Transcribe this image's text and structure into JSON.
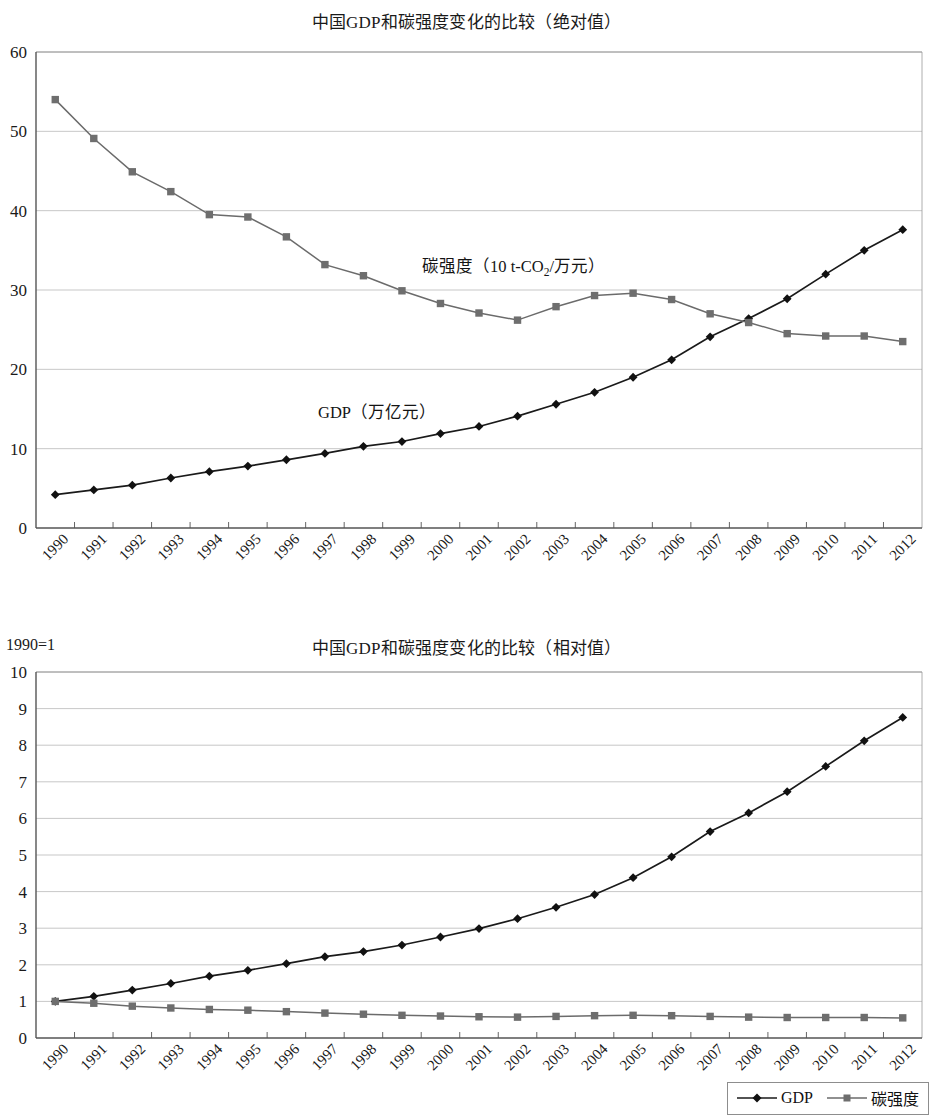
{
  "charts": {
    "absolute": {
      "title": "中国GDP和碳强度变化的比较（绝对值）",
      "gdp_annotation": "GDP（万亿元）",
      "intensity_annotation_pre": "碳强度（10 t-CO",
      "intensity_annotation_sub": "2",
      "intensity_annotation_post": "/万元）"
    },
    "relative": {
      "title": "中国GDP和碳强度变化的比较（相对值）",
      "base_note": "1990=1"
    }
  },
  "legend": {
    "gdp_label": "GDP",
    "intensity_label": "碳强度",
    "gdp_marker": "diamond-marker",
    "intensity_marker": "square-marker"
  },
  "colors": {
    "gdp_line": "#1a1a1a",
    "intensity_line": "#6b6b6b",
    "intensity_marker": "#6e6e6e",
    "grid": "#b9b9b9",
    "axis": "#555555"
  },
  "chart_data": [
    {
      "type": "line",
      "title": "中国GDP和碳强度变化的比较（绝对值）",
      "xlabel": "",
      "ylabel": "",
      "ylim": [
        0,
        60
      ],
      "yticks": [
        0,
        10,
        20,
        30,
        40,
        50,
        60
      ],
      "grid": true,
      "legend_position": "bottom-right",
      "x": [
        "1990",
        "1991",
        "1992",
        "1993",
        "1994",
        "1995",
        "1996",
        "1997",
        "1998",
        "1999",
        "2000",
        "2001",
        "2002",
        "2003",
        "2004",
        "2005",
        "2006",
        "2007",
        "2008",
        "2009",
        "2010",
        "2011",
        "2012"
      ],
      "series": [
        {
          "name": "GDP（万亿元）",
          "unit": "万亿元",
          "marker": "diamond",
          "values": [
            4.2,
            4.8,
            5.4,
            6.3,
            7.1,
            7.8,
            8.6,
            9.4,
            10.3,
            10.9,
            11.9,
            12.8,
            14.1,
            15.6,
            17.1,
            19.0,
            21.2,
            24.1,
            26.4,
            28.9,
            32.0,
            35.0,
            37.6
          ]
        },
        {
          "name": "碳强度（10 t-CO2/万元）",
          "unit": "10 t-CO2/万元",
          "marker": "square",
          "values": [
            54.0,
            49.1,
            44.9,
            42.4,
            39.5,
            39.2,
            36.7,
            33.2,
            31.8,
            29.9,
            28.3,
            27.1,
            26.2,
            27.9,
            29.3,
            29.6,
            28.8,
            27.0,
            25.9,
            24.5,
            24.2,
            24.2,
            23.5
          ]
        }
      ]
    },
    {
      "type": "line",
      "title": "中国GDP和碳强度变化的比较（相对值）",
      "xlabel": "",
      "ylabel": "1990=1",
      "ylim": [
        0,
        10
      ],
      "yticks": [
        0,
        1,
        2,
        3,
        4,
        5,
        6,
        7,
        8,
        9,
        10
      ],
      "grid": true,
      "legend_position": "bottom-right",
      "x": [
        "1990",
        "1991",
        "1992",
        "1993",
        "1994",
        "1995",
        "1996",
        "1997",
        "1998",
        "1999",
        "2000",
        "2001",
        "2002",
        "2003",
        "2004",
        "2005",
        "2006",
        "2007",
        "2008",
        "2009",
        "2010",
        "2011",
        "2012"
      ],
      "series": [
        {
          "name": "GDP",
          "marker": "diamond",
          "values": [
            1.0,
            1.14,
            1.31,
            1.49,
            1.69,
            1.85,
            2.03,
            2.22,
            2.36,
            2.54,
            2.76,
            2.99,
            3.26,
            3.57,
            3.92,
            4.38,
            4.95,
            5.64,
            6.15,
            6.73,
            7.42,
            8.12,
            8.76
          ]
        },
        {
          "name": "碳强度",
          "marker": "square",
          "values": [
            1.0,
            0.95,
            0.87,
            0.82,
            0.78,
            0.76,
            0.72,
            0.68,
            0.65,
            0.62,
            0.6,
            0.58,
            0.57,
            0.59,
            0.61,
            0.62,
            0.61,
            0.59,
            0.57,
            0.56,
            0.56,
            0.56,
            0.55
          ]
        }
      ]
    }
  ]
}
